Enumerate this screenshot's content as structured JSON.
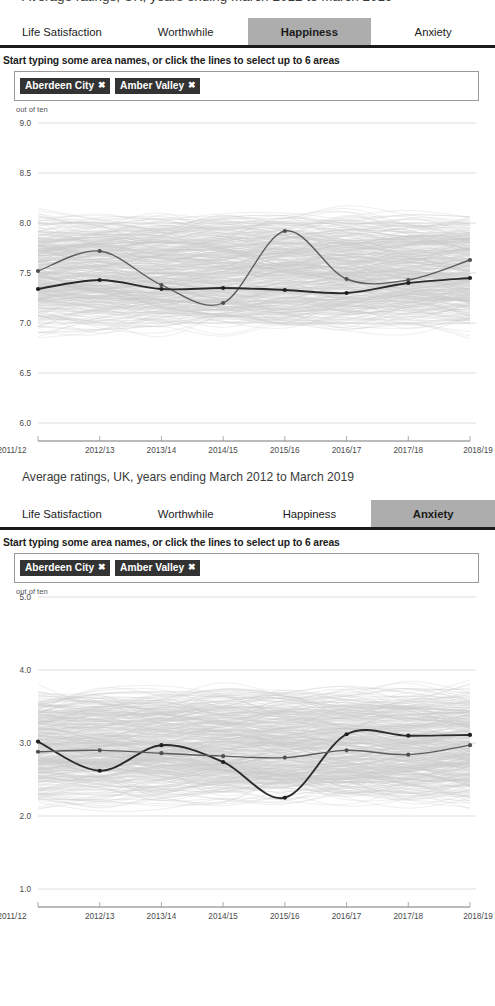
{
  "top_clipped_heading": "Average ratings, UK, years ending March 2012 to March 2019",
  "mid_caption": "Average ratings, UK, years ending March 2012 to March 2019",
  "instruction": "Start typing some area names, or click the lines to select up to 6 areas",
  "tabs": [
    {
      "label": "Life Satisfaction"
    },
    {
      "label": "Worthwhile"
    },
    {
      "label": "Happiness"
    },
    {
      "label": "Anxiety"
    }
  ],
  "active_tab_top": "Happiness",
  "active_tab_bottom": "Anxiety",
  "chips": [
    {
      "label": "Aberdeen City",
      "remove": "✖"
    },
    {
      "label": "Amber Valley",
      "remove": "✖"
    }
  ],
  "search_placeholder": "",
  "colors": {
    "tab_active_bg": "#adadad",
    "tab_underline": "#1b1b1b",
    "chip_bg": "#333333",
    "chip_text": "#ffffff",
    "series_primary": "#2b2b2b",
    "series_secondary": "#5c5c5c",
    "background_lines": "#c9c9c9",
    "gridline": "#d5d5d5"
  },
  "chart_data": [
    {
      "id": "happiness",
      "type": "line",
      "title": "Happiness",
      "xlabel": "",
      "ylabel": "out of ten",
      "unit_label": "out of ten",
      "categories": [
        "2011/12",
        "2012/13",
        "2013/14",
        "2014/15",
        "2015/16",
        "2016/17",
        "2017/18",
        "2018/19"
      ],
      "ylim": [
        6.0,
        9.0
      ],
      "yticks": [
        "9.0",
        "8.5",
        "8.0",
        "7.5",
        "7.0",
        "6.5",
        "6.0"
      ],
      "ytick_values": [
        9.0,
        8.5,
        8.0,
        7.5,
        7.0,
        6.5,
        6.0
      ],
      "grid": true,
      "legend": "none",
      "series": [
        {
          "name": "Aberdeen City",
          "style": "secondary",
          "values": [
            7.52,
            7.72,
            7.38,
            7.2,
            7.92,
            7.44,
            7.43,
            7.63
          ]
        },
        {
          "name": "Amber Valley",
          "style": "primary",
          "values": [
            7.34,
            7.43,
            7.34,
            7.35,
            7.33,
            7.3,
            7.4,
            7.45
          ]
        }
      ],
      "background_series_count": 380,
      "background_note": "All UK local areas shown as faint grey lines"
    },
    {
      "id": "anxiety",
      "type": "line",
      "title": "Anxiety",
      "xlabel": "",
      "ylabel": "out of ten",
      "unit_label": "out of ten",
      "categories": [
        "2011/12",
        "2012/13",
        "2013/14",
        "2014/15",
        "2015/16",
        "2016/17",
        "2017/18",
        "2018/19"
      ],
      "ylim": [
        1.0,
        5.0
      ],
      "yticks": [
        "5.0",
        "4.0",
        "3.0",
        "2.0",
        "1.0"
      ],
      "ytick_values": [
        5.0,
        4.0,
        3.0,
        2.0,
        1.0
      ],
      "grid": true,
      "legend": "none",
      "series": [
        {
          "name": "Aberdeen City",
          "style": "primary",
          "values": [
            3.02,
            2.62,
            2.97,
            2.74,
            2.25,
            3.12,
            3.1,
            3.11
          ]
        },
        {
          "name": "Amber Valley",
          "style": "secondary",
          "values": [
            2.88,
            2.9,
            2.86,
            2.82,
            2.8,
            2.9,
            2.84,
            2.97
          ]
        }
      ],
      "background_series_count": 380,
      "background_note": "All UK local areas shown as faint grey lines"
    }
  ]
}
